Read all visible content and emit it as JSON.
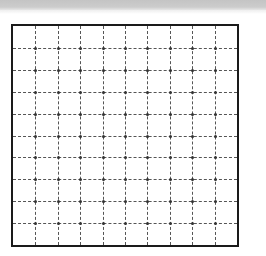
{
  "header_bar": {
    "color": "#c8c8c8"
  },
  "grid": {
    "rows": 10,
    "columns": 10,
    "border_color": "#1a1a1a",
    "line_style": "dashed",
    "line_color": "#555555",
    "intersection_dots": true
  }
}
